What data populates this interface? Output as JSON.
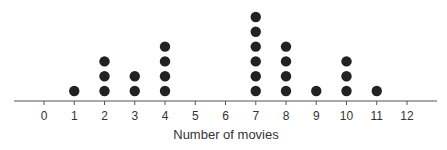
{
  "chart_data": {
    "type": "dot",
    "title": "",
    "xlabel": "Number of movies",
    "ylabel": "",
    "categories": [
      0,
      1,
      2,
      3,
      4,
      5,
      6,
      7,
      8,
      9,
      10,
      11,
      12
    ],
    "values": [
      0,
      1,
      3,
      2,
      4,
      0,
      0,
      6,
      4,
      1,
      3,
      1,
      0
    ],
    "xlim": [
      -1,
      13
    ],
    "grid": false,
    "legend": null,
    "colors": {
      "dot": "#222222",
      "axis": "#555555",
      "text": "#333333"
    }
  }
}
